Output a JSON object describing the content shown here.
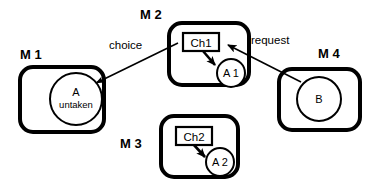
{
  "diagram": {
    "background_color": "#ffffff",
    "stroke_color": "#000000",
    "machines": [
      {
        "id": "m1",
        "label": "M 1",
        "node": {
          "name": "A",
          "sub": "untaken"
        }
      },
      {
        "id": "m2",
        "label": "M 2",
        "channel": {
          "name": "Ch1"
        },
        "node": {
          "name": "A 1",
          "sub": ""
        }
      },
      {
        "id": "m3",
        "label": "M 3",
        "channel": {
          "name": "Ch2"
        },
        "node": {
          "name": "A 2",
          "sub": ""
        }
      },
      {
        "id": "m4",
        "label": "M 4",
        "node": {
          "name": "B",
          "sub": ""
        }
      }
    ],
    "edges": [
      {
        "id": "choice",
        "label": "choice",
        "from": "m2-ch1",
        "to": "m1-a"
      },
      {
        "id": "request",
        "label": "request",
        "from": "m4-b",
        "to": "m2-ch1"
      }
    ],
    "internal_edges": [
      {
        "id": "ch1-to-a1",
        "from": "m2-ch1",
        "to": "m2-a1"
      },
      {
        "id": "ch2-to-a2",
        "from": "m3-ch2",
        "to": "m3-a2"
      }
    ]
  }
}
